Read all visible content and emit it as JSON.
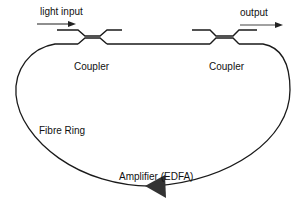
{
  "diagram": {
    "labels": {
      "input": "light input",
      "output": "output",
      "coupler_left": "Coupler",
      "coupler_right": "Coupler",
      "ring": "Fibre Ring",
      "amplifier": "Amplifier (EDFA)"
    },
    "colors": {
      "line": "#1a1a1a",
      "amplifier": "#333333"
    }
  }
}
